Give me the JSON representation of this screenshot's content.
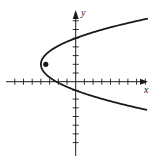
{
  "chart_data": {
    "type": "line",
    "title": "",
    "xlabel": "x",
    "ylabel": "y",
    "equation": "(y - 2)^2 = (9/4)(x + 4)",
    "vertex": [
      -4,
      2
    ],
    "focus": [
      -3.44,
      2
    ],
    "x_ticks": [
      -7,
      -6,
      -5,
      -4,
      -3,
      -2,
      -1,
      1,
      2,
      3,
      4,
      5,
      6,
      7,
      8
    ],
    "y_ticks": [
      -7,
      -6,
      -5,
      -4,
      -3,
      -2,
      -1,
      1,
      2,
      3,
      4,
      5,
      6,
      7
    ],
    "xlim": [
      -8.5,
      9.5
    ],
    "ylim": [
      -9,
      9
    ],
    "grid": false,
    "series": [
      {
        "name": "parabola",
        "x": [
          8.3,
          5,
          2.25,
          0,
          -1.75,
          -3,
          -3.75,
          -4,
          -3.75,
          -3,
          -1.75,
          0,
          2.25,
          5,
          8.3
        ],
        "y": [
          7.25,
          6.5,
          5.75,
          5,
          4.25,
          3.5,
          2.75,
          2,
          1.25,
          0.5,
          -0.25,
          -1,
          -1.75,
          -2.5,
          -3.25
        ]
      }
    ],
    "points": [
      {
        "label": "focus",
        "x": -3.44,
        "y": 2
      }
    ],
    "intercepts": {
      "y": [
        5,
        -1
      ],
      "x": [
        -2.22
      ]
    }
  },
  "axes": {
    "x_label": "x",
    "y_label": "y"
  },
  "colors": {
    "ink": "#1a1a1a",
    "background": "#ffffff"
  }
}
